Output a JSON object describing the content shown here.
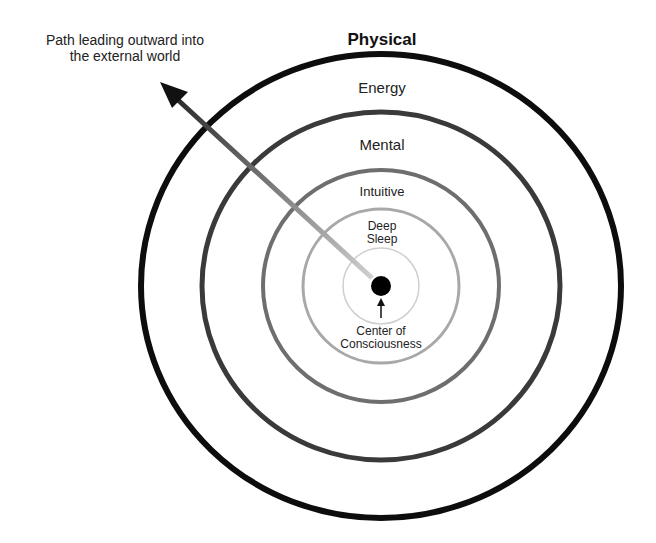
{
  "diagram": {
    "path_label": [
      "Path leading outward into",
      "the external world"
    ],
    "center_label": [
      "Center of",
      "Consciousness"
    ],
    "rings": [
      {
        "name": "Physical",
        "rx": 240,
        "ry": 232,
        "stroke": 6,
        "color": "#0d0d0d"
      },
      {
        "name": "Energy",
        "rx": 179,
        "ry": 174,
        "stroke": 5,
        "color": "#3a3a3a"
      },
      {
        "name": "Mental",
        "rx": 118,
        "ry": 116,
        "stroke": 4,
        "color": "#6e6e6e"
      },
      {
        "name": "Intuitive",
        "rx": 78,
        "ry": 77,
        "stroke": 3,
        "color": "#a8a8a8"
      },
      {
        "name": "Deep Sleep",
        "rx": 38,
        "ry": 38,
        "stroke": 1.5,
        "color": "#cfcfcf"
      }
    ],
    "deep_sleep_lines": [
      "Deep",
      "Sleep"
    ],
    "center": {
      "x": 381,
      "y": 286
    },
    "dot_color": "#000000"
  }
}
